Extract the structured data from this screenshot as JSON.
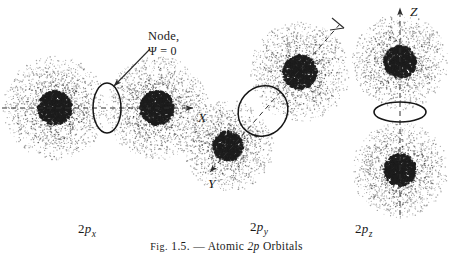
{
  "figure": {
    "caption_prefix": "Fig.",
    "caption_number": "1.5.",
    "caption_dash": "—",
    "caption_text_a": "Atomic",
    "caption_text_b": "2p",
    "caption_text_c": "Orbitals",
    "background_color": "#ffffff",
    "ink_color": "#1a1a1a"
  },
  "callout": {
    "line1": "Node,",
    "line2": "Ψ = 0"
  },
  "axes": {
    "x_label": "X",
    "y_label": "Y",
    "z_label": "Z"
  },
  "orbitals": [
    {
      "id": "2px",
      "prefix": "2",
      "letter": "p",
      "subscript": "x"
    },
    {
      "id": "2py",
      "prefix": "2",
      "letter": "p",
      "subscript": "y"
    },
    {
      "id": "2pz",
      "prefix": "2",
      "letter": "p",
      "subscript": "z"
    }
  ],
  "chart_data": {
    "type": "scatter",
    "title": "Atomic 2p Orbitals",
    "xlabel": "",
    "ylabel": "",
    "grid": false,
    "legend": "none",
    "annotations": [
      "Node,",
      "Ψ = 0"
    ],
    "series": [
      {
        "name": "2px",
        "axis_label": "X",
        "axis_angle_deg": 0,
        "axis_style": "dashed-with-arrow",
        "lobes": [
          {
            "cx": 55,
            "cy": 108,
            "r": 52,
            "core_r": 17
          },
          {
            "cx": 157,
            "cy": 108,
            "r": 52,
            "core_r": 17
          }
        ],
        "node": {
          "cx": 107,
          "cy": 108,
          "rx": 14,
          "ry": 25,
          "rotation_deg": 0
        }
      },
      {
        "name": "2py",
        "axis_label": "Y",
        "axis_angle_deg": 40,
        "axis_style": "dashed-with-arrow",
        "lobes": [
          {
            "cx": 300,
            "cy": 72,
            "r": 50,
            "core_r": 17
          },
          {
            "cx": 228,
            "cy": 146,
            "r": 46,
            "core_r": 15
          }
        ],
        "node": {
          "cx": 263,
          "cy": 111,
          "rx": 24,
          "ry": 26,
          "rotation_deg": 40
        }
      },
      {
        "name": "2pz",
        "axis_label": "Z",
        "axis_angle_deg": 90,
        "axis_style": "dashed-with-arrow",
        "lobes": [
          {
            "cx": 400,
            "cy": 62,
            "r": 48,
            "core_r": 16
          },
          {
            "cx": 400,
            "cy": 170,
            "r": 48,
            "core_r": 16
          }
        ],
        "node": {
          "cx": 400,
          "cy": 112,
          "rx": 26,
          "ry": 10,
          "rotation_deg": 0
        }
      }
    ]
  }
}
